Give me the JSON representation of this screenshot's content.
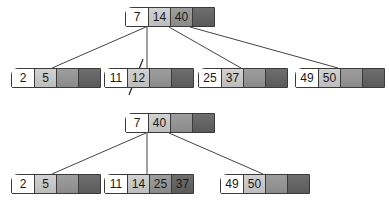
{
  "diagram": {
    "type": "b-tree-split",
    "before": {
      "root": {
        "keys": [
          "7",
          "14",
          "40",
          ""
        ]
      },
      "children": [
        {
          "keys": [
            "2",
            "5",
            "",
            ""
          ]
        },
        {
          "keys": [
            "11",
            "12",
            "",
            ""
          ],
          "struck_key": "12"
        },
        {
          "keys": [
            "25",
            "37",
            "",
            ""
          ]
        },
        {
          "keys": [
            "49",
            "50",
            "",
            ""
          ]
        }
      ]
    },
    "after": {
      "root": {
        "keys": [
          "7",
          "40",
          "",
          ""
        ]
      },
      "children": [
        {
          "keys": [
            "2",
            "5",
            "",
            ""
          ]
        },
        {
          "keys": [
            "11",
            "14",
            "25",
            "37"
          ]
        },
        {
          "keys": [
            "49",
            "50",
            "",
            ""
          ]
        }
      ]
    }
  }
}
